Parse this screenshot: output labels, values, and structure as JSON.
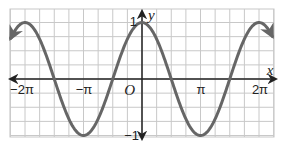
{
  "chart_data": {
    "type": "line",
    "title": "",
    "function": "y = cos(x)",
    "xlabel": "x",
    "ylabel": "y",
    "xlim": [
      -6.98,
      7.0
    ],
    "ylim": [
      -1.1,
      1.1
    ],
    "grid": true,
    "grid_step_x": "π/4",
    "grid_step_y": 0.25,
    "x_tick_labels": [
      "−2π",
      "−π",
      "O",
      "π",
      "2π"
    ],
    "x_tick_values": [
      -6.2832,
      -3.1416,
      0,
      3.1416,
      6.2832
    ],
    "y_tick_labels": [
      "1",
      "−1"
    ],
    "y_tick_values": [
      1,
      -1
    ],
    "series": [
      {
        "name": "cos x",
        "x": [
          -7.1,
          -6.2832,
          -4.7124,
          -3.1416,
          -1.5708,
          0,
          1.5708,
          3.1416,
          4.7124,
          6.2832,
          7.1
        ],
        "y": [
          0.68,
          1,
          0,
          -1,
          0,
          1,
          0,
          -1,
          0,
          1,
          0.68
        ],
        "color": "#666666",
        "arrows_both_ends": true
      }
    ]
  },
  "colors": {
    "grid": "#c8c8c8",
    "axis": "#222222",
    "curve": "#666666"
  }
}
